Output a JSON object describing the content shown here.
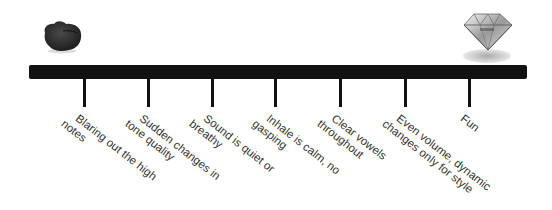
{
  "diagram": {
    "type": "scale-continuum",
    "left_end": {
      "icon": "rock-icon",
      "meaning": "rough / unpolished"
    },
    "right_end": {
      "icon": "diamond-icon",
      "meaning": "polished / brilliant"
    },
    "bar_color": "#111111",
    "text_color": "#333333",
    "ticks": [
      {
        "x": 84,
        "lines": [
          "Blaring out the high",
          "notes"
        ]
      },
      {
        "x": 148,
        "lines": [
          "Sudden changes in",
          "tone quality"
        ]
      },
      {
        "x": 212,
        "lines": [
          "Sound is quiet or",
          "breathy"
        ]
      },
      {
        "x": 275,
        "lines": [
          "Inhale is calm, no",
          "gasping"
        ]
      },
      {
        "x": 340,
        "lines": [
          "Clear vowels",
          "throughout"
        ]
      },
      {
        "x": 405,
        "lines": [
          "Even volume, dynamic",
          "changes only for style"
        ]
      },
      {
        "x": 469,
        "lines": [
          "Fun"
        ]
      }
    ]
  }
}
